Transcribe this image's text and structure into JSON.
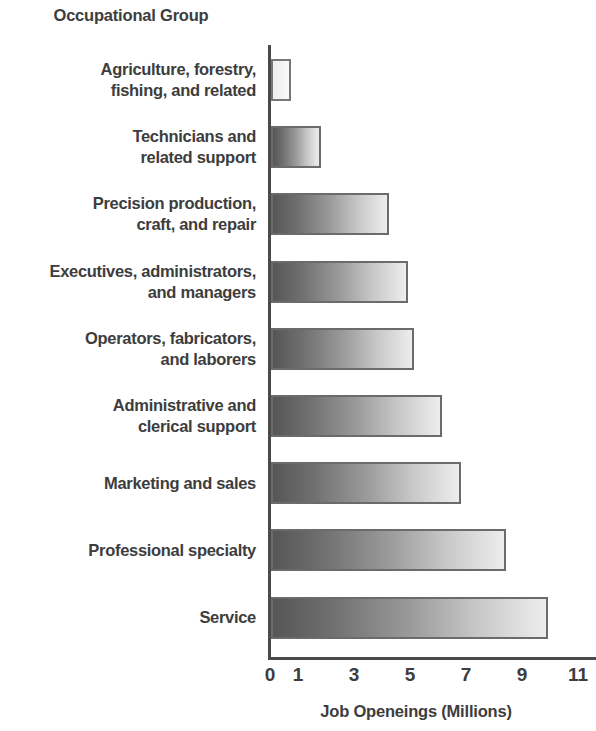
{
  "chart_data": {
    "type": "bar",
    "orientation": "horizontal",
    "title": "",
    "ylabel": "Occupational Group",
    "xlabel": "Job Openeings (Millions)",
    "xlim": [
      0,
      11
    ],
    "xticks": [
      0,
      1,
      3,
      5,
      7,
      9,
      11
    ],
    "xtick_labels": [
      "0",
      "1",
      "3",
      "5",
      "7",
      "9",
      "11"
    ],
    "grid": false,
    "legend": false,
    "categories": [
      "Agriculture, forestry, fishing, and related",
      "Technicians and related support",
      "Precision production, craft, and repair",
      "Executives, administrators, and managers",
      "Operators, fabricators, and laborers",
      "Administrative and clerical support",
      "Marketing and sales",
      "Professional specialty",
      "Service"
    ],
    "values": [
      0.7,
      1.8,
      4.2,
      4.9,
      5.1,
      6.1,
      6.8,
      8.4,
      9.9
    ],
    "bars": [
      {
        "category": "Agriculture, forestry, fishing, and related",
        "label_lines": [
          "Agriculture, forestry,",
          "fishing, and related"
        ],
        "value": 0.7,
        "style": "pale"
      },
      {
        "category": "Technicians and related support",
        "label_lines": [
          "Technicians and",
          "related support"
        ],
        "value": 1.8,
        "style": "gradient"
      },
      {
        "category": "Precision production, craft, and repair",
        "label_lines": [
          "Precision production,",
          "craft, and repair"
        ],
        "value": 4.2,
        "style": "gradient"
      },
      {
        "category": "Executives, administrators, and managers",
        "label_lines": [
          "Executives, administrators,",
          "and managers"
        ],
        "value": 4.9,
        "style": "gradient"
      },
      {
        "category": "Operators, fabricators, and laborers",
        "label_lines": [
          "Operators, fabricators,",
          "and laborers"
        ],
        "value": 5.1,
        "style": "gradient"
      },
      {
        "category": "Administrative and clerical support",
        "label_lines": [
          "Administrative and",
          "clerical support"
        ],
        "value": 6.1,
        "style": "gradient"
      },
      {
        "category": "Marketing and sales",
        "label_lines": [
          "Marketing and sales"
        ],
        "value": 6.8,
        "style": "gradient"
      },
      {
        "category": "Professional specialty",
        "label_lines": [
          "Professional specialty"
        ],
        "value": 8.4,
        "style": "gradient"
      },
      {
        "category": "Service",
        "label_lines": [
          "Service"
        ],
        "value": 9.9,
        "style": "gradient"
      }
    ]
  },
  "colors": {
    "axis": "#4a4a4a",
    "text": "#3d3d3d",
    "bar_border": "#6b6b6b",
    "bar_gradient_start": "#565656",
    "bar_gradient_end": "#ededed",
    "background": "#ffffff"
  }
}
